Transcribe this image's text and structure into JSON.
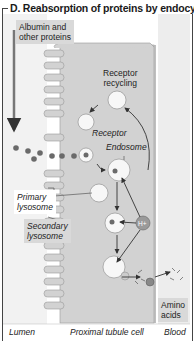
{
  "title": "D. Reabsorption of proteins by endocytosis",
  "labels": {
    "albumin_line1": "Albumin and",
    "albumin_line2": "other proteins",
    "receptor_recycling_line1": "Receptor",
    "receptor_recycling_line2": "recycling",
    "receptor": "Receptor",
    "endosome": "Endosome",
    "primary_lysosome_line1": "Primary",
    "primary_lysosome_line2": "lysosome",
    "secondary_lysosome_line1": "Secondary",
    "secondary_lysosome_line2": "lysosome",
    "proton": "H+",
    "amino_acids_line1": "Amino",
    "amino_acids_line2": "acids",
    "lumen": "Lumen",
    "proximal_tubule_cell": "Proximal tubule cell",
    "blood": "Blood"
  },
  "colors": {
    "cell": "#d2d2d2",
    "lumen": "#f2f2f2",
    "blood": "#ececec",
    "protein": "#6a6a6a",
    "vesicle": "#f7f7f7",
    "arrow": "#333333",
    "label_box": "#d9d9d9"
  }
}
